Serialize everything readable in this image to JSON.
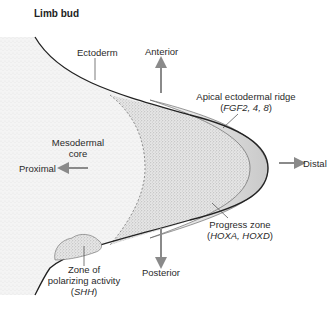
{
  "title": "Limb bud",
  "labels": {
    "ectoderm": "Ectoderm",
    "anterior": "Anterior",
    "aer_line1": "Apical ectodermal ridge",
    "aer_line2_open": "(",
    "aer_genes": "FGF2, 4, 8",
    "aer_line2_close": ")",
    "mesoderm_line1": "Mesodermal",
    "mesoderm_line2": "core",
    "proximal": "Proximal",
    "distal": "Distal",
    "progress_line1": "Progress zone",
    "progress_genes": "HOXA, HOXD",
    "zpa_line1": "Zone of",
    "zpa_line2": "polarizing activity",
    "zpa_genes": "SHH",
    "posterior": "Posterior"
  },
  "colors": {
    "outline": "#222222",
    "arrow": "#8a8a8a",
    "stipple": "#d9d9d9",
    "aer_fill": "#eeeeee"
  }
}
